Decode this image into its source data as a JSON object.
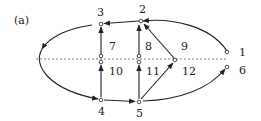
{
  "figure": {
    "panel_label": "(a)",
    "nodes": [
      {
        "id": "1",
        "label": "1"
      },
      {
        "id": "2",
        "label": "2"
      },
      {
        "id": "3",
        "label": "3"
      },
      {
        "id": "4",
        "label": "4"
      },
      {
        "id": "5",
        "label": "5"
      },
      {
        "id": "6",
        "label": "6"
      },
      {
        "id": "7",
        "label": "7"
      },
      {
        "id": "8",
        "label": "8"
      },
      {
        "id": "9",
        "label": "9"
      },
      {
        "id": "10",
        "label": "10"
      },
      {
        "id": "11",
        "label": "11"
      },
      {
        "id": "12",
        "label": "12"
      }
    ],
    "edges": [
      {
        "from": "1",
        "to": "2",
        "type": "curved"
      },
      {
        "from": "2",
        "to": "3",
        "type": "straight"
      },
      {
        "from": "3",
        "to": "4",
        "type": "curved-left"
      },
      {
        "from": "4",
        "to": "5",
        "type": "straight"
      },
      {
        "from": "5",
        "to": "6",
        "type": "curved"
      },
      {
        "from": "7",
        "to": "3",
        "type": "straight"
      },
      {
        "from": "8",
        "to": "2",
        "type": "straight"
      },
      {
        "from": "9",
        "to": "2",
        "type": "straight"
      },
      {
        "from": "4",
        "to": "10",
        "type": "straight"
      },
      {
        "from": "5",
        "to": "11",
        "type": "straight"
      },
      {
        "from": "5",
        "to": "12",
        "type": "straight"
      }
    ],
    "divider": "dashed-horizontal"
  }
}
